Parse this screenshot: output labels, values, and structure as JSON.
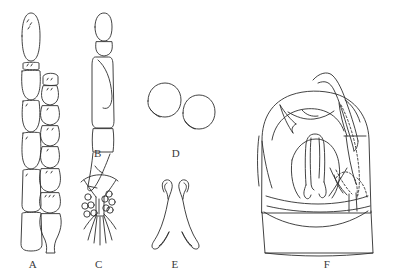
{
  "figure": {
    "type": "scientific-line-drawing-plate",
    "background_color": "#ffffff",
    "ink_color": "#2e2e2e",
    "panel_count": 6,
    "width": 394,
    "height": 273
  },
  "panels": [
    {
      "key": "A",
      "label": "A",
      "name": "panel-a-antennae",
      "subject": "antenna, two segmented antennal chains side by side",
      "label_x": 33,
      "label_y": 266,
      "elements": "left chain of 5 elongate segments with basal setae; right chain of 7 shorter barrel segments ending in a flask-shaped apical segment"
    },
    {
      "key": "B",
      "label": "B",
      "name": "panel-b-appendage",
      "subject": "elongate leg or palp in lateral view",
      "label_x": 98,
      "label_y": 155,
      "elements": "oval apical segment, short second segment, long slender tibia with inner fold, tapering tarsus with pointed claw"
    },
    {
      "key": "C",
      "label": "C",
      "name": "panel-c-sensory-field",
      "subject": "ventral sensory plate with pore circles",
      "label_x": 99,
      "label_y": 266,
      "elements": "broad arc above, V-shaped median sclerite, ten ring-shaped pores flanking midline, fine radiating setae below"
    },
    {
      "key": "D",
      "label": "D",
      "name": "panel-d-spermathecae",
      "subject": "two rounded spermathecae",
      "label_x": 176,
      "label_y": 155,
      "elements": "two sub-circular capsules each with a short basal neck"
    },
    {
      "key": "E",
      "label": "E",
      "name": "panel-e-parameres",
      "subject": "paired hook-tipped parameres",
      "label_x": 175,
      "label_y": 266,
      "elements": "mirror-image pair of slender arms, each with a recurved hooked apex and an expanded foot"
    },
    {
      "key": "F",
      "label": "F",
      "name": "panel-f-genital-capsule",
      "subject": "male genital capsule, caudal view",
      "label_x": 327,
      "label_y": 266,
      "elements": "dome-shaped capsule, long curved dorsal horn, pointed left spine, inverted-U median process, dotted hidden arcs at right, wavy basal band"
    }
  ]
}
